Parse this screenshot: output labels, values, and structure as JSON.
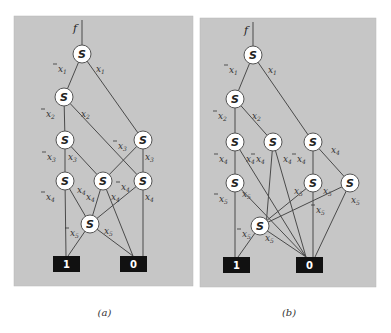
{
  "panels": [
    {
      "id": "a",
      "caption": "(a)",
      "function_label": "f",
      "frame": {
        "x": 14,
        "y": 16,
        "w": 179,
        "h": 270
      },
      "root_stub": {
        "x": 82,
        "y1": 20,
        "y2": 45
      },
      "nodes": [
        {
          "id": "a1",
          "label": "S",
          "x": 82,
          "y": 54
        },
        {
          "id": "a2",
          "label": "S",
          "x": 64,
          "y": 97
        },
        {
          "id": "a3l",
          "label": "S",
          "x": 65,
          "y": 140
        },
        {
          "id": "a3r",
          "label": "S",
          "x": 143,
          "y": 140
        },
        {
          "id": "a4l",
          "label": "S",
          "x": 65,
          "y": 181
        },
        {
          "id": "a4m",
          "label": "S",
          "x": 103,
          "y": 181
        },
        {
          "id": "a4r",
          "label": "S",
          "x": 143,
          "y": 181
        },
        {
          "id": "a5",
          "label": "S",
          "x": 90,
          "y": 224
        }
      ],
      "terminals": [
        {
          "id": "a_t1",
          "label": "1",
          "x": 53,
          "y": 256,
          "w": 27,
          "h": 16
        },
        {
          "id": "a_t0",
          "label": "0",
          "x": 120,
          "y": 256,
          "w": 27,
          "h": 16
        }
      ],
      "edges": [
        {
          "from": [
            82,
            54
          ],
          "to": [
            64,
            97
          ]
        },
        {
          "from": [
            82,
            54
          ],
          "to": [
            143,
            140
          ]
        },
        {
          "from": [
            64,
            97
          ],
          "to": [
            65,
            140
          ]
        },
        {
          "from": [
            64,
            97
          ],
          "to": [
            143,
            181
          ]
        },
        {
          "from": [
            65,
            140
          ],
          "to": [
            65,
            181
          ]
        },
        {
          "from": [
            65,
            140
          ],
          "to": [
            103,
            181
          ]
        },
        {
          "from": [
            143,
            140
          ],
          "to": [
            103,
            181
          ]
        },
        {
          "from": [
            143,
            140
          ],
          "to": [
            143,
            181
          ]
        },
        {
          "from": [
            65,
            181
          ],
          "to": [
            66,
            256
          ]
        },
        {
          "from": [
            65,
            181
          ],
          "to": [
            90,
            224
          ]
        },
        {
          "from": [
            103,
            181
          ],
          "to": [
            90,
            224
          ]
        },
        {
          "from": [
            103,
            181
          ],
          "to": [
            133,
            256
          ]
        },
        {
          "from": [
            143,
            181
          ],
          "to": [
            90,
            224
          ]
        },
        {
          "from": [
            143,
            181
          ],
          "to": [
            143,
            256
          ]
        },
        {
          "from": [
            90,
            224
          ],
          "to": [
            68,
            256
          ]
        },
        {
          "from": [
            90,
            224
          ],
          "to": [
            133,
            256
          ]
        }
      ],
      "labels": [
        {
          "text": "x",
          "sub": "1",
          "neg": true,
          "x": 58,
          "y": 72
        },
        {
          "text": "x",
          "sub": "1",
          "neg": false,
          "x": 96,
          "y": 72
        },
        {
          "text": "x",
          "sub": "2",
          "neg": true,
          "x": 46,
          "y": 117
        },
        {
          "text": "x",
          "sub": "2",
          "neg": false,
          "x": 81,
          "y": 117
        },
        {
          "text": "x",
          "sub": "3",
          "neg": true,
          "x": 47,
          "y": 160
        },
        {
          "text": "x",
          "sub": "3",
          "neg": false,
          "x": 68,
          "y": 160
        },
        {
          "text": "x",
          "sub": "3",
          "neg": true,
          "x": 118,
          "y": 149
        },
        {
          "text": "x",
          "sub": "3",
          "neg": false,
          "x": 145,
          "y": 160
        },
        {
          "text": "x",
          "sub": "4",
          "neg": true,
          "x": 46,
          "y": 200
        },
        {
          "text": "x",
          "sub": "4",
          "neg": false,
          "x": 77,
          "y": 193
        },
        {
          "text": "x",
          "sub": "4",
          "neg": false,
          "x": 86,
          "y": 200
        },
        {
          "text": "x",
          "sub": "4",
          "neg": false,
          "x": 111,
          "y": 200
        },
        {
          "text": "x",
          "sub": "4",
          "neg": true,
          "x": 121,
          "y": 190
        },
        {
          "text": "x",
          "sub": "4",
          "neg": false,
          "x": 145,
          "y": 200
        },
        {
          "text": "x",
          "sub": "5",
          "neg": true,
          "x": 70,
          "y": 236
        },
        {
          "text": "x",
          "sub": "5",
          "neg": false,
          "x": 104,
          "y": 234
        }
      ]
    },
    {
      "id": "b",
      "caption": "(b)",
      "function_label": "f",
      "frame": {
        "x": 200,
        "y": 18,
        "w": 176,
        "h": 269
      },
      "root_stub": {
        "x": 253,
        "y1": 22,
        "y2": 46
      },
      "nodes": [
        {
          "id": "b1",
          "label": "S",
          "x": 253,
          "y": 55
        },
        {
          "id": "b2",
          "label": "S",
          "x": 235,
          "y": 99
        },
        {
          "id": "b3l",
          "label": "S",
          "x": 235,
          "y": 142
        },
        {
          "id": "b3m",
          "label": "S",
          "x": 273,
          "y": 142
        },
        {
          "id": "b3r",
          "label": "S",
          "x": 313,
          "y": 142
        },
        {
          "id": "b4l",
          "label": "S",
          "x": 235,
          "y": 183
        },
        {
          "id": "b4m",
          "label": "S",
          "x": 313,
          "y": 183
        },
        {
          "id": "b4r",
          "label": "S",
          "x": 350,
          "y": 183
        },
        {
          "id": "b5",
          "label": "S",
          "x": 260,
          "y": 226
        }
      ],
      "terminals": [
        {
          "id": "b_t1",
          "label": "1",
          "x": 223,
          "y": 257,
          "w": 27,
          "h": 16
        },
        {
          "id": "b_t0",
          "label": "0",
          "x": 296,
          "y": 257,
          "w": 27,
          "h": 16
        }
      ],
      "edges": [
        {
          "from": [
            253,
            55
          ],
          "to": [
            235,
            99
          ]
        },
        {
          "from": [
            253,
            55
          ],
          "to": [
            313,
            142
          ]
        },
        {
          "from": [
            235,
            99
          ],
          "to": [
            235,
            142
          ]
        },
        {
          "from": [
            235,
            99
          ],
          "to": [
            273,
            142
          ]
        },
        {
          "from": [
            235,
            142
          ],
          "to": [
            235,
            183
          ]
        },
        {
          "from": [
            235,
            142
          ],
          "to": [
            306,
            257
          ]
        },
        {
          "from": [
            273,
            142
          ],
          "to": [
            266,
            226
          ]
        },
        {
          "from": [
            273,
            142
          ],
          "to": [
            306,
            257
          ]
        },
        {
          "from": [
            313,
            142
          ],
          "to": [
            313,
            183
          ]
        },
        {
          "from": [
            313,
            142
          ],
          "to": [
            350,
            183
          ]
        },
        {
          "from": [
            235,
            183
          ],
          "to": [
            235,
            257
          ]
        },
        {
          "from": [
            235,
            183
          ],
          "to": [
            306,
            257
          ]
        },
        {
          "from": [
            313,
            183
          ],
          "to": [
            260,
            226
          ]
        },
        {
          "from": [
            313,
            183
          ],
          "to": [
            313,
            257
          ]
        },
        {
          "from": [
            350,
            183
          ],
          "to": [
            260,
            226
          ]
        },
        {
          "from": [
            350,
            183
          ],
          "to": [
            315,
            257
          ]
        },
        {
          "from": [
            260,
            226
          ],
          "to": [
            238,
            257
          ]
        },
        {
          "from": [
            260,
            226
          ],
          "to": [
            306,
            257
          ]
        }
      ],
      "labels": [
        {
          "text": "x",
          "sub": "1",
          "neg": true,
          "x": 229,
          "y": 73
        },
        {
          "text": "x",
          "sub": "1",
          "neg": false,
          "x": 268,
          "y": 73
        },
        {
          "text": "x",
          "sub": "2",
          "neg": true,
          "x": 218,
          "y": 119
        },
        {
          "text": "x",
          "sub": "2",
          "neg": false,
          "x": 252,
          "y": 119
        },
        {
          "text": "x",
          "sub": "4",
          "neg": true,
          "x": 219,
          "y": 162
        },
        {
          "text": "x",
          "sub": "4",
          "neg": false,
          "x": 246,
          "y": 162
        },
        {
          "text": "x",
          "sub": "4",
          "neg": true,
          "x": 256,
          "y": 162
        },
        {
          "text": "x",
          "sub": "4",
          "neg": false,
          "x": 283,
          "y": 162
        },
        {
          "text": "x",
          "sub": "4",
          "neg": true,
          "x": 297,
          "y": 162
        },
        {
          "text": "x",
          "sub": "4",
          "neg": false,
          "x": 331,
          "y": 153
        },
        {
          "text": "x",
          "sub": "5",
          "neg": true,
          "x": 219,
          "y": 202
        },
        {
          "text": "x",
          "sub": "5",
          "neg": false,
          "x": 242,
          "y": 197
        },
        {
          "text": "x",
          "sub": "5",
          "neg": false,
          "x": 294,
          "y": 194
        },
        {
          "text": "x",
          "sub": "5",
          "neg": true,
          "x": 323,
          "y": 194
        },
        {
          "text": "x",
          "sub": "5",
          "neg": false,
          "x": 351,
          "y": 203
        },
        {
          "text": "x",
          "sub": "5",
          "neg": true,
          "x": 316,
          "y": 213
        },
        {
          "text": "x",
          "sub": "5",
          "neg": true,
          "x": 242,
          "y": 237
        },
        {
          "text": "x",
          "sub": "5",
          "neg": false,
          "x": 265,
          "y": 241
        }
      ]
    }
  ]
}
